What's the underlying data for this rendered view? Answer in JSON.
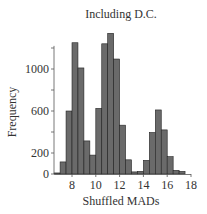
{
  "chart_data": {
    "type": "bar",
    "title": "Including D.C.",
    "xlabel": "Shuffled MADs",
    "ylabel": "Frequency",
    "bin_width": 0.5,
    "bins_start": [
      6.5,
      7.0,
      7.5,
      8.0,
      8.5,
      9.0,
      9.5,
      10.0,
      10.5,
      11.0,
      11.5,
      12.0,
      12.5,
      13.0,
      13.5,
      14.0,
      14.5,
      15.0,
      15.5,
      16.0,
      16.5,
      17.0
    ],
    "values": [
      10,
      115,
      600,
      1250,
      1010,
      315,
      180,
      625,
      1240,
      1340,
      1095,
      465,
      135,
      20,
      25,
      130,
      395,
      610,
      420,
      165,
      35,
      25
    ],
    "xlim": [
      6.5,
      18
    ],
    "ylim": [
      0,
      1220
    ],
    "x_ticks": [
      8,
      10,
      12,
      14,
      16,
      18
    ],
    "y_ticks": [
      0,
      200,
      400,
      600,
      800,
      1000,
      1200
    ],
    "y_tick_labels": [
      "0",
      "200",
      "",
      "600",
      "",
      "1000",
      ""
    ],
    "grid": false,
    "legend": null
  }
}
